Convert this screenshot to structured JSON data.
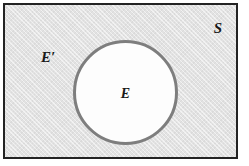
{
  "figure": {
    "type": "venn-diagram",
    "canvas": {
      "width": 249,
      "height": 166,
      "background": "#ffffff"
    },
    "universal_set": {
      "label": "S",
      "shape": "rectangle",
      "fill_color": "#e2e2e2",
      "border_color": "#232323",
      "meaning": "sample space"
    },
    "event_set": {
      "label": "E",
      "shape": "circle",
      "fill_color": "#fdfdfd",
      "border_color": "#7e7e7e",
      "meaning": "event"
    },
    "complement_set": {
      "label": "E′",
      "shape": "region",
      "meaning": "complement of event E"
    }
  }
}
